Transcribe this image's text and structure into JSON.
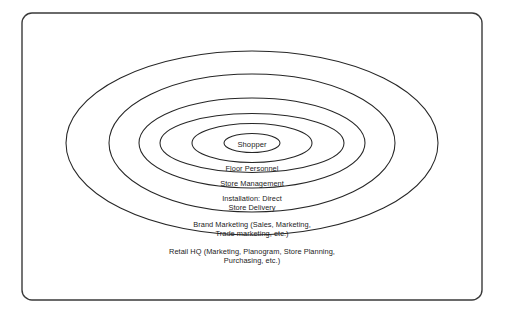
{
  "diagram": {
    "type": "concentric-ellipse",
    "frame": {
      "shape": "rounded-rectangle",
      "x": 22,
      "y": 13,
      "width": 460,
      "height": 287,
      "corner_radius": 10,
      "stroke_color": "#3a3a3a",
      "fill_color": "#ffffff"
    },
    "center": {
      "x": 252,
      "y": 143
    },
    "ring_stroke_color": "#262626",
    "text_color": "#1c1c1c",
    "rings": [
      {
        "index": 1,
        "name": "shopper",
        "label": "Shopper",
        "rx": 28,
        "ry": 9.5,
        "label_x": 252,
        "label_y": 139.5,
        "label_position": "inside-center"
      },
      {
        "index": 2,
        "name": "floor-personnel",
        "label": "Floor Personnel",
        "rx": 60,
        "ry": 19.5,
        "label_x": 252,
        "label_y": 163.5,
        "label_position": "below-arc"
      },
      {
        "index": 3,
        "name": "store-management",
        "label": "Store Management",
        "rx": 92,
        "ry": 29.5,
        "label_x": 252,
        "label_y": 178.5,
        "label_position": "below-arc"
      },
      {
        "index": 4,
        "name": "installation-direct-store-delivery",
        "label": "Installation: Direct\nStore Delivery",
        "rx": 113,
        "ry": 45,
        "label_x": 252,
        "label_y": 194,
        "label_position": "below-arc"
      },
      {
        "index": 5,
        "name": "brand-marketing",
        "label": "Brand Marketing (Sales, Marketing,\nTrade marketing, etc.)",
        "rx": 143,
        "ry": 69,
        "label_x": 252,
        "label_y": 220,
        "label_position": "below-arc"
      },
      {
        "index": 6,
        "name": "retail-hq",
        "label": "Retail HQ (Marketing, Planogram, Store Planning,\nPurchasing, etc.)",
        "rx": 186,
        "ry": 92,
        "label_x": 252,
        "label_y": 247,
        "label_position": "below-arc"
      }
    ]
  }
}
